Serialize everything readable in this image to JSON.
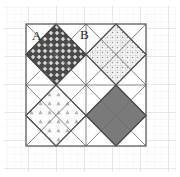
{
  "figure": {
    "labels": [
      {
        "id": "A",
        "text": "A",
        "x": 32,
        "y": 29
      },
      {
        "id": "B",
        "text": "B",
        "x": 80,
        "y": 28
      }
    ],
    "square": {
      "x": 26,
      "y": 24,
      "width": 120,
      "height": 122,
      "stroke": "#5a5a5a",
      "stroke_width": 1.2,
      "fill": "#ffffff"
    },
    "background_grid": {
      "minor_spacing": 7,
      "major_spacing": 28,
      "minor_color": "#efefef",
      "major_color": "#d8d8d8",
      "visible": true
    },
    "cells": [
      {
        "name": "top-left",
        "label": "A",
        "diamond_fill_name": "dark-cross-dot",
        "fill_color": "#4a4a4a",
        "pattern_color": "#ffffff",
        "outline": "#3a3a3a"
      },
      {
        "name": "top-right",
        "label": "B",
        "diamond_fill_name": "light-dot-grid",
        "fill_color": "#f2f2f2",
        "pattern_color": "#9a9a9a",
        "outline": "#6a6a6a"
      },
      {
        "name": "bottom-left",
        "label": "",
        "diamond_fill_name": "light-triangles",
        "fill_color": "#fbfbfb",
        "pattern_color": "#b0b0b0",
        "outline": "#6a6a6a"
      },
      {
        "name": "bottom-right",
        "label": "",
        "diamond_fill_name": "solid-gray",
        "fill_color": "#777777",
        "pattern_color": "#777777",
        "outline": "#4a4a4a"
      }
    ],
    "diagonal_lines": {
      "color": "#6a6a6a",
      "stroke_width": 0.9,
      "description": "diagonals of each quadrant forming triangle subdivisions"
    }
  }
}
